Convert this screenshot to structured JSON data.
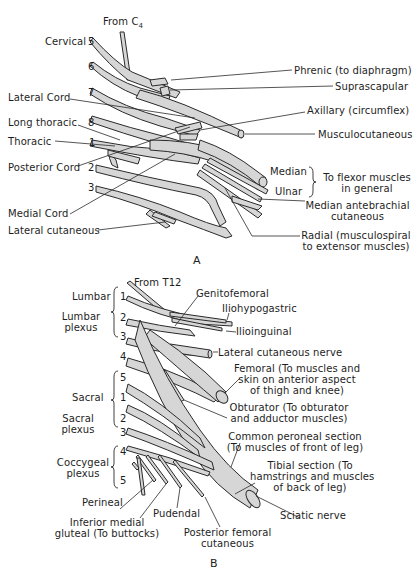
{
  "figure_a": {
    "caption": "A",
    "title": "Brachial plexus",
    "origin_label": "From C",
    "origin_subscript": "4",
    "root_numbers": [
      "5",
      "6",
      "7",
      "8",
      "1",
      "2",
      "3"
    ],
    "left_labels": {
      "cervical": "Cervical",
      "lateral_cord": "Lateral Cord",
      "long_thoracic": "Long thoracic",
      "thoracic": "Thoracic",
      "posterior_cord": "Posterior Cord",
      "medial_cord": "Medial Cord",
      "lateral_cutaneous": "Lateral cutaneous"
    },
    "right_labels": {
      "phrenic": "Phrenic (to diaphragm)",
      "suprascapular": "Suprascapular",
      "axillary": "Axillary (circumflex)",
      "musculocutaneous": "Musculocutaneous",
      "median": "Median",
      "ulnar": "Ulnar",
      "flexor_line1": "To flexor muscles",
      "flexor_line2": "in general",
      "median_antebrachial_line1": "Median antebrachial",
      "median_antebrachial_line2": "cutaneous",
      "radial_line1": "Radial (musculospiral",
      "radial_line2": "to extensor muscles)"
    }
  },
  "figure_b": {
    "caption": "B",
    "title": "Lumbosacral plexus",
    "origin_label": "From T12",
    "root_numbers": {
      "lumbar": [
        "1",
        "2",
        "3",
        "4"
      ],
      "sacral": [
        "5",
        "1",
        "2",
        "3"
      ],
      "coccygeal": [
        "4",
        "5"
      ]
    },
    "left_labels": {
      "lumbar": "Lumbar",
      "lumbar_plexus_line1": "Lumbar",
      "lumbar_plexus_line2": "plexus",
      "sacral": "Sacral",
      "sacral_plexus_line1": "Sacral",
      "sacral_plexus_line2": "plexus",
      "coccygeal_plexus_line1": "Coccygeal",
      "coccygeal_plexus_line2": "plexus",
      "perineal": "Perineal",
      "inferior_medial_line1": "Inferior medial",
      "inferior_medial_line2": "gluteal (To buttocks)",
      "pudendal": "Pudendal",
      "posterior_femoral_line1": "Posterior femoral",
      "posterior_femoral_line2": "cutaneous"
    },
    "right_labels": {
      "genitofemoral": "Genitofemoral",
      "iliohypogastric": "Iliohypogastric",
      "ilioinguinal": "Ilioinguinal",
      "lateral_cutaneous_nerve": "Lateral cutaneous nerve",
      "femoral_line1": "Femoral (To muscles and",
      "femoral_line2": "skin on anterior aspect",
      "femoral_line3": "of thigh and knee)",
      "obturator_line1": "Obturator (To obturator",
      "obturator_line2": "and adductor muscles)",
      "peroneal_line1": "Common peroneal section",
      "peroneal_line2": "(To muscles of front of leg)",
      "tibial_line1": "Tibial section (To",
      "tibial_line2": "hamstrings and muscles",
      "tibial_line3": "of back of leg)",
      "sciatic": "Sciatic nerve"
    }
  }
}
